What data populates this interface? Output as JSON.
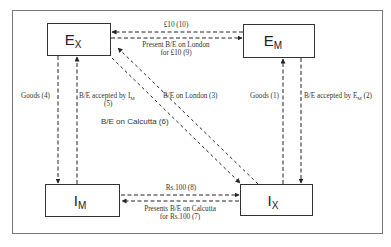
{
  "diagram": {
    "nodes": {
      "ex": {
        "main": "E",
        "sub": "X"
      },
      "em": {
        "main": "E",
        "sub": "M"
      },
      "im": {
        "main": "I",
        "sub": "M"
      },
      "ix": {
        "main": "I",
        "sub": "X"
      }
    },
    "edges": {
      "goods_1": "Goods (1)",
      "accepted_em_2_prefix": "B/E accepted by E",
      "accepted_em_2_sub": "M",
      "accepted_em_2_suffix": " (2)",
      "be_london_3": "B/E on London   (3)",
      "goods_4": "Goods (4)",
      "accepted_im_5_line1_prefix": "B/E accepted by I",
      "accepted_im_5_line1_sub": "M",
      "accepted_im_5_line2": "(5)",
      "be_calcutta_6": "B/E on Calcutta (6)",
      "presents_calcutta_7_line1": "Presents B/E on Calcutta",
      "presents_calcutta_7_line2": "for Rs.100 (7)",
      "rs100_8": "Rs.100   (8)",
      "present_london_9_line1": "Present B/E on London",
      "present_london_9_line2": "for £10 (9)",
      "pound10_10": "£10 (10)"
    },
    "colors": {
      "line": "#222222",
      "frame": "#666666",
      "text": "#333333",
      "background": "#ffffff"
    }
  }
}
